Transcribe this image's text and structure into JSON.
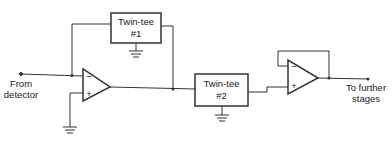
{
  "diagram": {
    "input_label_line1": "From",
    "input_label_line2": "detector",
    "output_label_line1": "To further",
    "output_label_line2": "stages",
    "filter1": {
      "name": "Twin-tee",
      "number": "#1"
    },
    "filter2": {
      "name": "Twin-tee",
      "number": "#2"
    },
    "opamp1": {
      "inverting": "−",
      "noninverting": "+"
    },
    "opamp2": {
      "inverting": "−",
      "noninverting": "+"
    },
    "line_color": "#333333"
  }
}
